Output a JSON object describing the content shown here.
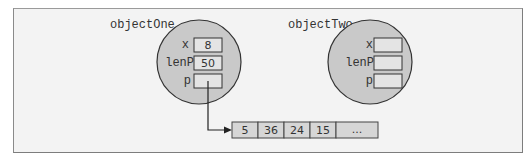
{
  "objects": [
    {
      "name": "objectOne",
      "fields": [
        {
          "label": "x",
          "value": "8"
        },
        {
          "label": "lenP",
          "value": "50"
        },
        {
          "label": "p",
          "value": ""
        }
      ]
    },
    {
      "name": "objectTwo",
      "fields": [
        {
          "label": "x",
          "value": ""
        },
        {
          "label": "lenP",
          "value": ""
        },
        {
          "label": "p",
          "value": ""
        }
      ]
    }
  ],
  "array": {
    "cells": [
      "5",
      "36",
      "24",
      "15",
      "..."
    ]
  },
  "pointer": {
    "from": "objectOne.p",
    "to": "array"
  },
  "colors": {
    "circle_fill": "#c9c9c9",
    "box_fill": "#e4e4e4",
    "array_fill": "#d6d6d6",
    "stroke": "#333333"
  }
}
